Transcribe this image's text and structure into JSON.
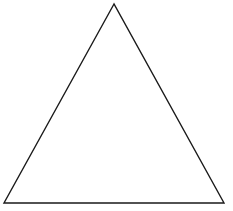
{
  "diagram": {
    "shape": "triangle",
    "type": "isosceles",
    "fill": "none",
    "stroke_color": "#1a1a1a",
    "stroke_width": 1.4,
    "vertices": {
      "apex": [
        114,
        4
      ],
      "bottom_left": [
        4,
        203
      ],
      "bottom_right": [
        224,
        203
      ]
    }
  }
}
